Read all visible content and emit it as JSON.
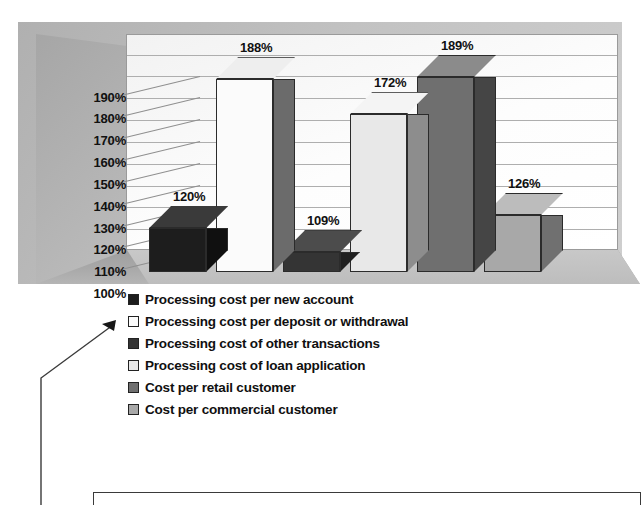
{
  "chart_data": {
    "type": "bar",
    "title": "",
    "subtitle": "",
    "xlabel": "",
    "ylabel": "",
    "ylim": [
      100,
      195
    ],
    "grid": true,
    "legend_position": "bottom-left",
    "axis_ticks": [
      "100%",
      "110%",
      "120%",
      "130%",
      "140%",
      "150%",
      "160%",
      "170%",
      "180%",
      "190%"
    ],
    "categories": [
      "Processing cost per new account",
      "Processing cost per deposit or withdrawal",
      "Processing cost of other transactions",
      "Processing cost of loan application",
      "Cost per retail customer",
      "Cost per commercial customer"
    ],
    "values": [
      120,
      188,
      109,
      172,
      189,
      126
    ],
    "value_labels": [
      "120%",
      "188%",
      "109%",
      "172%",
      "189%",
      "126%"
    ],
    "series": [
      {
        "name": "Cost index",
        "values": [
          120,
          188,
          109,
          172,
          189,
          126
        ]
      }
    ],
    "bar_colors": [
      "#1d1d1d",
      "#fbfbfb",
      "#343434",
      "#e8e8e8",
      "#6f6f6f",
      "#a8a8a8"
    ],
    "bar_side_colors": [
      "#101010",
      "#6b6b6b",
      "#1f1f1f",
      "#8d8d8d",
      "#454545",
      "#707070"
    ],
    "bar_top_colors": [
      "#3a3a3a",
      "#eeeeee",
      "#4c4c4c",
      "#f4f4f4",
      "#8b8b8b",
      "#bcbcbc"
    ]
  },
  "legend": {
    "items": [
      {
        "label": "Processing cost per new account",
        "color": "#1d1d1d"
      },
      {
        "label": "Processing cost per deposit or withdrawal",
        "color": "#fbfbfb"
      },
      {
        "label": "Processing cost of other transactions",
        "color": "#343434"
      },
      {
        "label": "Processing cost of loan application",
        "color": "#e8e8e8"
      },
      {
        "label": "Cost per retail customer",
        "color": "#6f6f6f"
      },
      {
        "label": "Cost per commercial customer",
        "color": "#a8a8a8"
      }
    ]
  },
  "callout": {
    "target_legend_index": 1,
    "arrow_icon": "arrow-left-icon"
  },
  "colors": {
    "panel_background": "#b9b9b9",
    "plot_background": "#fbfbfb",
    "gridline": "#aeaeae",
    "text": "#111111",
    "outline": "#3a3a3a"
  }
}
